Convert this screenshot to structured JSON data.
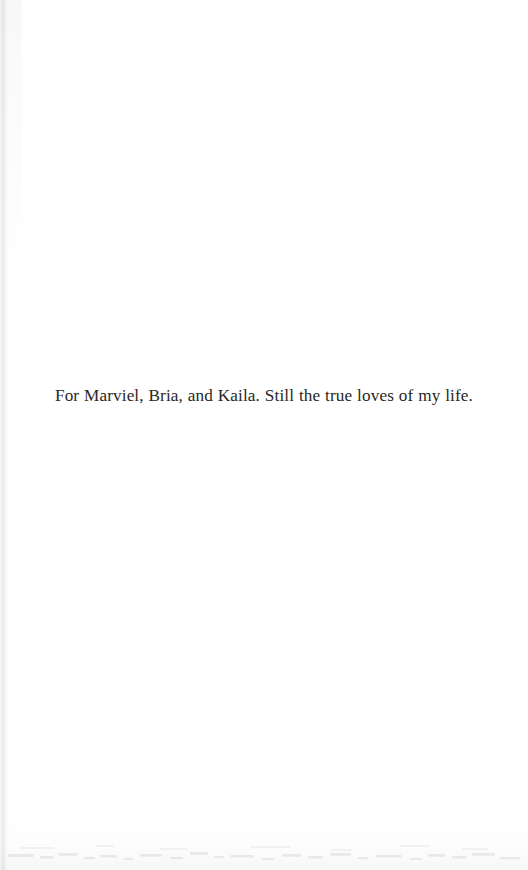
{
  "page": {
    "kind": "book-dedication-page",
    "width": 528,
    "height": 870,
    "background_color": "#ffffff",
    "text_color": "#2a2724"
  },
  "dedication": {
    "text": "For Marviel, Bria, and Kaila. Still the true loves of my life.",
    "alignment": "center"
  },
  "artifacts": {
    "gutter_shadow_color": "#b6b6b8",
    "bottom_noise_color": "#cdcdcf"
  }
}
